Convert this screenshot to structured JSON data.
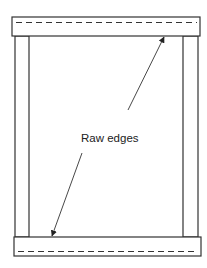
{
  "diagram": {
    "label": "Raw edges",
    "colors": {
      "line": "#333333",
      "background": "#ffffff"
    },
    "top_bar": {
      "x": 12,
      "y": 17,
      "w": 188,
      "h": 19
    },
    "bottom_bar": {
      "x": 14,
      "y": 237,
      "w": 187,
      "h": 19
    },
    "left_post": {
      "x": 15,
      "y": 36,
      "w": 14,
      "h": 201
    },
    "right_post": {
      "x": 183,
      "y": 36,
      "w": 15,
      "h": 201
    },
    "arrow_upper": {
      "from": [
        128,
        110
      ],
      "to": [
        164,
        37
      ]
    },
    "arrow_lower": {
      "from": [
        82,
        153
      ],
      "to": [
        52,
        236
      ]
    }
  }
}
